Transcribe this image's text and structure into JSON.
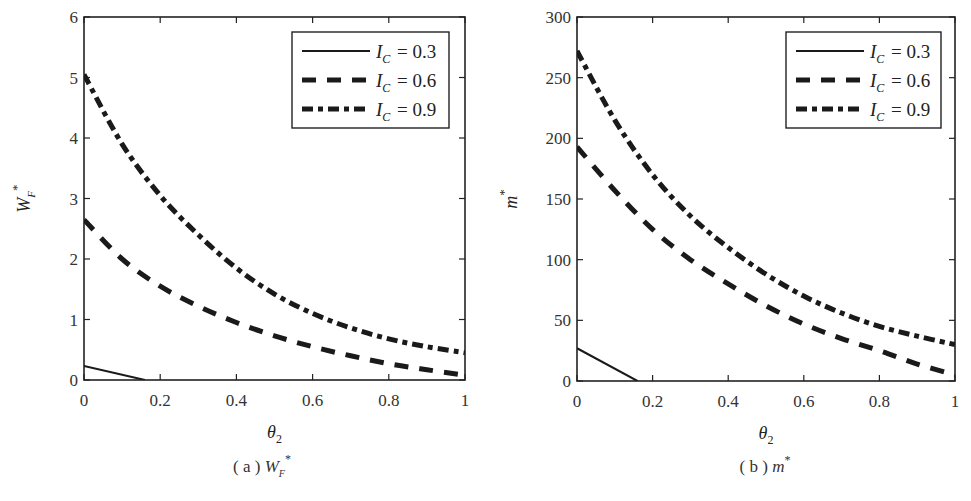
{
  "figure": {
    "legend": [
      {
        "symbol": "I",
        "subscript": "C",
        "value": "= 0.3",
        "style": "solid"
      },
      {
        "symbol": "I",
        "subscript": "C",
        "value": "= 0.6",
        "style": "dashed"
      },
      {
        "symbol": "I",
        "subscript": "C",
        "value": "= 0.9",
        "style": "dashdot"
      }
    ],
    "line_color": "#1a1a1a"
  },
  "chart_data": [
    {
      "type": "line",
      "panel": "a",
      "caption": "(a) W_F*",
      "caption_prefix": "( a )",
      "caption_symbol": "W",
      "caption_sub": "F",
      "caption_sup": "*",
      "xlabel": "θ2",
      "xlabel_symbol": "θ",
      "xlabel_sub": "2",
      "ylabel": "W_F*",
      "ylabel_symbol": "W",
      "ylabel_sub": "F",
      "ylabel_sup": "*",
      "xlim": [
        0,
        1
      ],
      "ylim": [
        0,
        6
      ],
      "xticks": [
        "0",
        "0.2",
        "0.4",
        "0.6",
        "0.8",
        "1"
      ],
      "yticks": [
        "0",
        "1",
        "2",
        "3",
        "4",
        "5",
        "6"
      ],
      "grid": false,
      "legend_position": "upper right",
      "series": [
        {
          "name": "I_C = 0.3",
          "style": "solid",
          "x": [
            0,
            0.16
          ],
          "y": [
            0.23,
            0
          ]
        },
        {
          "name": "I_C = 0.6",
          "style": "dashed",
          "x": [
            0,
            0.1,
            0.2,
            0.3,
            0.4,
            0.5,
            0.6,
            0.7,
            0.8,
            0.9,
            1.0
          ],
          "y": [
            2.65,
            2.0,
            1.55,
            1.22,
            0.95,
            0.73,
            0.55,
            0.4,
            0.27,
            0.17,
            0.08
          ]
        },
        {
          "name": "I_C = 0.9",
          "style": "dashdot",
          "x": [
            0,
            0.1,
            0.2,
            0.3,
            0.4,
            0.5,
            0.6,
            0.7,
            0.8,
            0.9,
            1.0
          ],
          "y": [
            5.05,
            3.9,
            3.05,
            2.4,
            1.85,
            1.42,
            1.1,
            0.86,
            0.68,
            0.55,
            0.45
          ]
        }
      ]
    },
    {
      "type": "line",
      "panel": "b",
      "caption": "(b) m*",
      "caption_prefix": "( b )",
      "caption_symbol": "m",
      "caption_sup": "*",
      "xlabel": "θ2",
      "xlabel_symbol": "θ",
      "xlabel_sub": "2",
      "ylabel": "m*",
      "ylabel_symbol": "m",
      "ylabel_sup": "*",
      "xlim": [
        0,
        1
      ],
      "ylim": [
        0,
        300
      ],
      "xticks": [
        "0",
        "0.2",
        "0.4",
        "0.6",
        "0.8",
        "1"
      ],
      "yticks": [
        "0",
        "50",
        "100",
        "150",
        "200",
        "250",
        "300"
      ],
      "grid": false,
      "legend_position": "upper right",
      "series": [
        {
          "name": "I_C = 0.3",
          "style": "solid",
          "x": [
            0,
            0.16
          ],
          "y": [
            27,
            0
          ]
        },
        {
          "name": "I_C = 0.6",
          "style": "dashed",
          "x": [
            0,
            0.1,
            0.2,
            0.3,
            0.4,
            0.5,
            0.6,
            0.7,
            0.8,
            0.9,
            1.0
          ],
          "y": [
            193,
            157,
            125,
            100,
            80,
            62,
            47,
            35,
            25,
            14,
            5
          ]
        },
        {
          "name": "I_C = 0.9",
          "style": "dashdot",
          "x": [
            0,
            0.1,
            0.2,
            0.3,
            0.4,
            0.5,
            0.6,
            0.7,
            0.8,
            0.9,
            1.0
          ],
          "y": [
            272,
            215,
            170,
            136,
            110,
            88,
            70,
            56,
            45,
            37,
            30
          ]
        }
      ]
    }
  ]
}
